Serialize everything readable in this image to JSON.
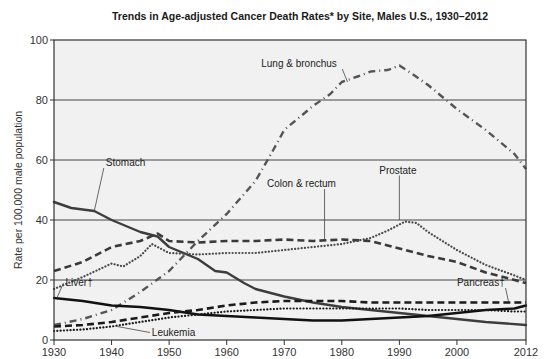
{
  "chart_data": {
    "type": "line",
    "title": "Trends in Age-adjusted Cancer Death Rates* by Site, Males  U.S., 1930–2012",
    "xlabel": "",
    "ylabel": "Rate per 100,000 male population",
    "xlim": [
      1930,
      2012
    ],
    "ylim": [
      0,
      100
    ],
    "x_ticks": [
      1930,
      1940,
      1950,
      1960,
      1970,
      1980,
      1990,
      2000,
      2012
    ],
    "x_tick_labels": [
      "1930",
      "1940",
      "1950",
      "1960",
      "1970",
      "1980",
      "1990",
      "2000",
      "2012"
    ],
    "y_ticks": [
      0,
      20,
      40,
      60,
      80,
      100
    ],
    "y_tick_labels": [
      "0",
      "20",
      "40",
      "60",
      "80",
      "100"
    ],
    "grid": {
      "horizontal": true,
      "vertical": false,
      "at": [
        20,
        40,
        60,
        80
      ]
    },
    "legend": "inline annotations",
    "plot_background": "#f1f1f1",
    "series": [
      {
        "name": "Lung & bronchus",
        "style": "dash-dot",
        "color": "#555555",
        "x": [
          1930,
          1935,
          1940,
          1945,
          1950,
          1955,
          1960,
          1965,
          1968,
          1970,
          1975,
          1978,
          1980,
          1983,
          1985,
          1988,
          1990,
          1992,
          1995,
          2000,
          2005,
          2010,
          2012
        ],
        "values": [
          5,
          7,
          10,
          16,
          23,
          33,
          42,
          53,
          63,
          70,
          78,
          82,
          86,
          88,
          89.5,
          90,
          91.5,
          89,
          85,
          77,
          70,
          62,
          57
        ]
      },
      {
        "name": "Stomach",
        "style": "solid",
        "color": "#3d3d3d",
        "x": [
          1930,
          1933,
          1937,
          1940,
          1945,
          1948,
          1950,
          1955,
          1958,
          1960,
          1963,
          1965,
          1970,
          1975,
          1980,
          1985,
          1990,
          1995,
          2000,
          2005,
          2012
        ],
        "values": [
          46,
          44,
          43,
          40,
          36,
          34.5,
          31,
          27,
          23,
          22.5,
          19,
          17,
          14.5,
          12.5,
          11,
          10,
          9,
          8,
          7,
          6,
          5
        ]
      },
      {
        "name": "Colon & rectum",
        "style": "dashed",
        "color": "#3a3a3a",
        "x": [
          1930,
          1935,
          1940,
          1945,
          1948,
          1950,
          1955,
          1960,
          1965,
          1970,
          1975,
          1980,
          1985,
          1990,
          1995,
          2000,
          2005,
          2010,
          2012
        ],
        "values": [
          23,
          26,
          31,
          33,
          35.5,
          33,
          32.5,
          33,
          33,
          33.5,
          33,
          33.5,
          33,
          30.5,
          28,
          26,
          22.5,
          20,
          19
        ]
      },
      {
        "name": "Prostate",
        "style": "dotted",
        "color": "#4a4a4a",
        "x": [
          1930,
          1935,
          1940,
          1942,
          1945,
          1947,
          1950,
          1955,
          1960,
          1965,
          1970,
          1975,
          1980,
          1985,
          1988,
          1991,
          1993,
          1995,
          2000,
          2005,
          2010,
          2012
        ],
        "values": [
          17,
          21,
          25.5,
          24.5,
          28,
          32,
          29,
          28.5,
          29,
          29,
          30,
          31,
          32,
          34,
          36.5,
          39.5,
          39,
          36,
          30,
          25,
          21.5,
          20
        ]
      },
      {
        "name": "Liver†",
        "style": "solid",
        "color": "#111111",
        "x": [
          1930,
          1935,
          1940,
          1945,
          1950,
          1955,
          1960,
          1965,
          1970,
          1975,
          1980,
          1985,
          1990,
          1995,
          2000,
          2005,
          2010,
          2012
        ],
        "values": [
          14,
          13,
          11.5,
          11,
          10,
          8.5,
          8,
          7.5,
          7,
          6.5,
          6.5,
          7,
          7.5,
          8,
          9,
          10,
          10.5,
          11.5
        ]
      },
      {
        "name": "Pancreas†",
        "style": "dashed",
        "color": "#1a1a1a",
        "x": [
          1930,
          1935,
          1940,
          1945,
          1950,
          1955,
          1960,
          1965,
          1970,
          1975,
          1980,
          1985,
          1990,
          1995,
          2000,
          2005,
          2010,
          2012
        ],
        "values": [
          4.5,
          5,
          6,
          7.5,
          9,
          10,
          11.5,
          12.5,
          13,
          13,
          13,
          12.5,
          12.5,
          12.5,
          12.5,
          12.5,
          12.5,
          12.5
        ]
      },
      {
        "name": "Leukemia",
        "style": "dotted",
        "color": "#1a1a1a",
        "x": [
          1930,
          1935,
          1940,
          1945,
          1950,
          1955,
          1960,
          1965,
          1970,
          1975,
          1980,
          1985,
          1990,
          1995,
          2000,
          2005,
          2010,
          2012
        ],
        "values": [
          3,
          3.5,
          4.5,
          6,
          7.5,
          8.5,
          9.5,
          10,
          10.5,
          10.5,
          10.5,
          10.5,
          10.5,
          10,
          10,
          10,
          9.5,
          9.5
        ]
      }
    ],
    "annotations": [
      {
        "text": "Lung & bronchus",
        "x": 1966,
        "y": 91,
        "pointer_to": [
          1981,
          86
        ]
      },
      {
        "text": "Stomach",
        "x": 1939,
        "y": 58,
        "pointer_to": [
          1937,
          43
        ]
      },
      {
        "text": "Colon & rectum",
        "x": 1967,
        "y": 51,
        "pointer_to": [
          1977,
          33.5
        ]
      },
      {
        "text": "Prostate",
        "x": 1986.5,
        "y": 55.5,
        "pointer_to": [
          1990,
          40
        ]
      },
      {
        "text": "Liver†",
        "x": 1932,
        "y": 18,
        "pointer_to": [
          1930.5,
          14
        ]
      },
      {
        "text": "Pancreas†",
        "x": 2000,
        "y": 18,
        "pointer_to": [
          2009,
          12.5
        ]
      },
      {
        "text": "Leukemia",
        "x": 1947,
        "y": 1.5,
        "pointer_to": [
          1941,
          4.5
        ]
      }
    ]
  }
}
